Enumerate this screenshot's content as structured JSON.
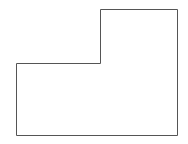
{
  "diagram": {
    "shape": "L-shaped polygon outline",
    "points": [
      [
        100,
        9
      ],
      [
        177,
        9
      ],
      [
        177,
        135
      ],
      [
        16,
        135
      ],
      [
        16,
        63
      ],
      [
        100,
        63
      ]
    ],
    "stroke": "#555555",
    "stroke_width": 1,
    "fill": "#ffffff",
    "background": "#ffffff"
  }
}
